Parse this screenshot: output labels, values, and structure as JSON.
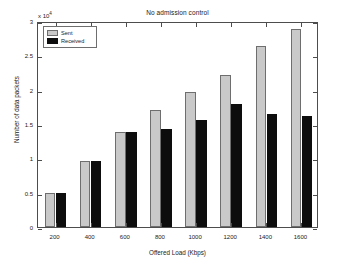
{
  "chart_data": {
    "type": "bar",
    "title": "No admission control",
    "xlabel": "Offered Load (Kbps)",
    "ylabel": "Number of data packets",
    "y_exponent_label": "x 10",
    "y_exponent_power": "4",
    "y_scale_factor": 10000,
    "categories": [
      "200",
      "400",
      "600",
      "800",
      "1000",
      "1200",
      "1400",
      "1600"
    ],
    "series": [
      {
        "name": "Sent",
        "color": "#c9c9c9",
        "values": [
          0.49,
          0.96,
          1.38,
          1.71,
          1.96,
          2.21,
          2.64,
          2.88
        ]
      },
      {
        "name": "Received",
        "color": "#0d0d0d",
        "values": [
          0.49,
          0.96,
          1.38,
          1.43,
          1.56,
          1.79,
          1.65,
          1.62
        ]
      }
    ],
    "ylim": [
      0,
      3
    ],
    "yticks": [
      "0",
      "0.5",
      "1",
      "1.5",
      "2",
      "2.5",
      "3"
    ],
    "ytick_values": [
      0,
      0.5,
      1,
      1.5,
      2,
      2.5,
      3
    ],
    "xticks": [
      "200",
      "400",
      "600",
      "800",
      "1000",
      "1200",
      "1400",
      "1600"
    ],
    "grid": false,
    "legend_position": "upper-left"
  },
  "legend": {
    "entries": [
      {
        "label": "Sent"
      },
      {
        "label": "Received"
      }
    ]
  }
}
